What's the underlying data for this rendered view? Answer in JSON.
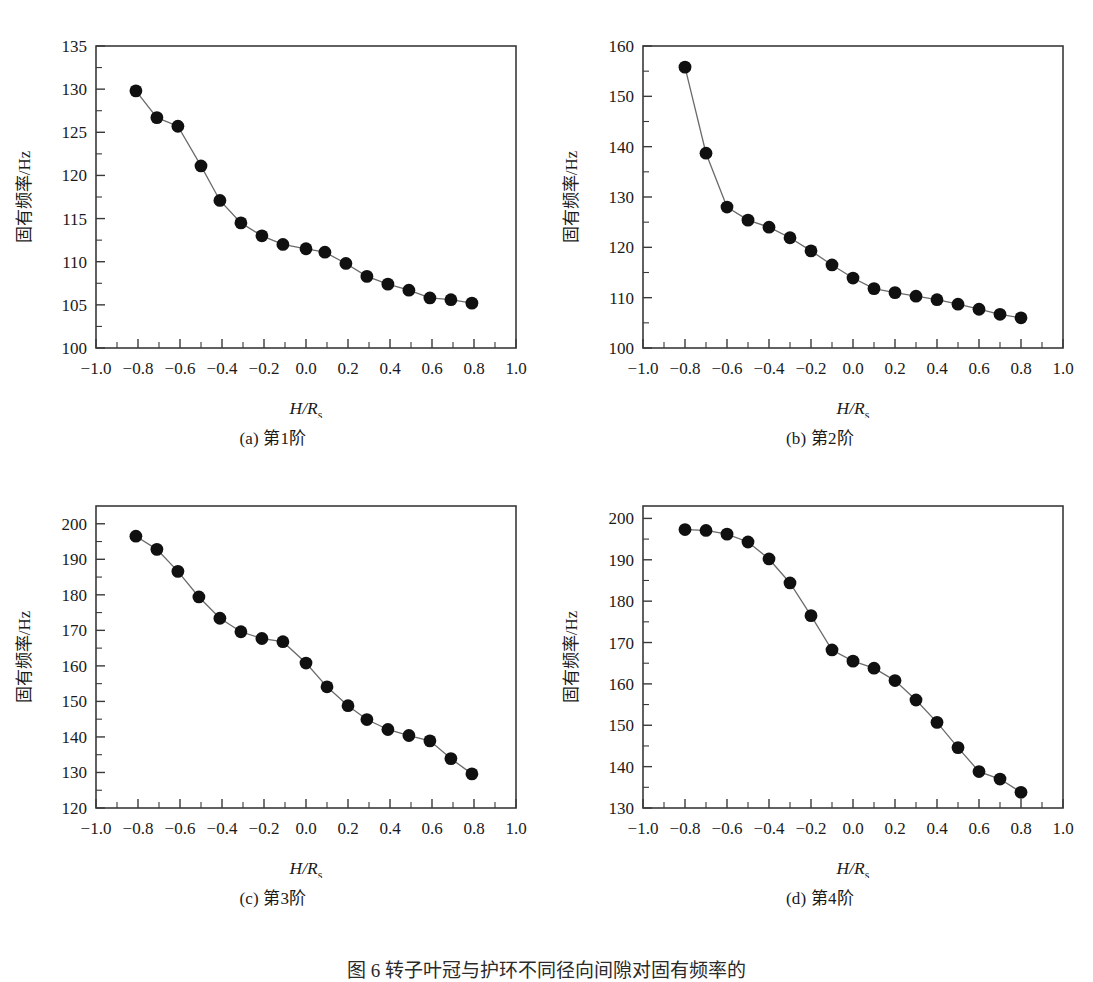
{
  "figure": {
    "caption": "图 6   转子叶冠与护环不同径向间隙对固有频率的",
    "axis_y_label": "固有频率/Hz",
    "axis_x_label_main": "H/R",
    "axis_x_label_sub": "s",
    "x_ticks": [
      "-1.0",
      "-0.8",
      "-0.6",
      "-0.4",
      "-0.2",
      "0.0",
      "0.2",
      "0.4",
      "0.6",
      "0.8",
      "1.0"
    ],
    "marker_color": "#101010",
    "line_color": "#6b6b6b",
    "frame_color": "#3a3a3a"
  },
  "chart_data": [
    {
      "type": "line",
      "panel": "a",
      "caption": "(a) 第1阶",
      "title": "",
      "xlabel": "H/Rs",
      "ylabel": "固有频率/Hz",
      "xlim": [
        -1.0,
        1.0
      ],
      "ylim": [
        100,
        135
      ],
      "yticks": [
        100,
        105,
        110,
        115,
        120,
        125,
        130,
        135
      ],
      "ytick_labels": [
        "100",
        "105",
        "110",
        "115",
        "120",
        "125",
        "130",
        "135"
      ],
      "xticks": [
        -1.0,
        -0.8,
        -0.6,
        -0.4,
        -0.2,
        0.0,
        0.2,
        0.4,
        0.6,
        0.8,
        1.0
      ],
      "grid": false,
      "legend": null,
      "x": [
        -0.81,
        -0.71,
        -0.61,
        -0.5,
        -0.41,
        -0.31,
        -0.21,
        -0.11,
        0.0,
        0.09,
        0.19,
        0.29,
        0.39,
        0.49,
        0.59,
        0.69,
        0.79
      ],
      "values": [
        129.8,
        126.7,
        125.7,
        121.1,
        117.1,
        114.5,
        113.0,
        112.0,
        111.5,
        111.1,
        109.8,
        108.3,
        107.4,
        106.7,
        105.8,
        105.6,
        105.2
      ]
    },
    {
      "type": "line",
      "panel": "b",
      "caption": "(b) 第2阶",
      "title": "",
      "xlabel": "H/Rs",
      "ylabel": "固有频率/Hz",
      "xlim": [
        -1.0,
        1.0
      ],
      "ylim": [
        100,
        160
      ],
      "yticks": [
        100,
        110,
        120,
        130,
        140,
        150,
        160
      ],
      "ytick_labels": [
        "100",
        "110",
        "120",
        "130",
        "140",
        "150",
        "160"
      ],
      "xticks": [
        -1.0,
        -0.8,
        -0.6,
        -0.4,
        -0.2,
        0.0,
        0.2,
        0.4,
        0.6,
        0.8,
        1.0
      ],
      "grid": false,
      "legend": null,
      "x": [
        -0.8,
        -0.7,
        -0.6,
        -0.5,
        -0.4,
        -0.3,
        -0.2,
        -0.1,
        0.0,
        0.1,
        0.2,
        0.3,
        0.4,
        0.5,
        0.6,
        0.7,
        0.8
      ],
      "values": [
        155.8,
        138.7,
        128.0,
        125.4,
        124.0,
        121.9,
        119.3,
        116.5,
        113.9,
        111.8,
        111.0,
        110.3,
        109.6,
        108.7,
        107.7,
        106.7,
        106.0
      ]
    },
    {
      "type": "line",
      "panel": "c",
      "caption": "(c) 第3阶",
      "title": "",
      "xlabel": "H/Rs",
      "ylabel": "固有频率/Hz",
      "xlim": [
        -1.0,
        1.0
      ],
      "ylim": [
        120,
        205
      ],
      "yticks": [
        120,
        130,
        140,
        150,
        160,
        170,
        180,
        190,
        200
      ],
      "ytick_labels": [
        "120",
        "130",
        "140",
        "150",
        "160",
        "170",
        "180",
        "190",
        "200"
      ],
      "xticks": [
        -1.0,
        -0.8,
        -0.6,
        -0.4,
        -0.2,
        0.0,
        0.2,
        0.4,
        0.6,
        0.8,
        1.0
      ],
      "grid": false,
      "legend": null,
      "x": [
        -0.81,
        -0.71,
        -0.61,
        -0.51,
        -0.41,
        -0.31,
        -0.21,
        -0.11,
        0.0,
        0.1,
        0.2,
        0.29,
        0.39,
        0.49,
        0.59,
        0.69,
        0.79
      ],
      "values": [
        196.5,
        192.8,
        186.6,
        179.4,
        173.4,
        169.6,
        167.7,
        166.8,
        160.8,
        154.1,
        148.8,
        144.9,
        142.1,
        140.4,
        138.9,
        133.9,
        129.6
      ]
    },
    {
      "type": "line",
      "panel": "d",
      "caption": "(d) 第4阶",
      "title": "",
      "xlabel": "H/Rs",
      "ylabel": "固有频率/Hz",
      "xlim": [
        -1.0,
        1.0
      ],
      "ylim": [
        130,
        203
      ],
      "yticks": [
        130,
        140,
        150,
        160,
        170,
        180,
        190,
        200
      ],
      "ytick_labels": [
        "130",
        "140",
        "150",
        "160",
        "170",
        "180",
        "190",
        "200"
      ],
      "xticks": [
        -1.0,
        -0.8,
        -0.6,
        -0.4,
        -0.2,
        0.0,
        0.2,
        0.4,
        0.6,
        0.8,
        1.0
      ],
      "grid": false,
      "legend": null,
      "x": [
        -0.8,
        -0.7,
        -0.6,
        -0.5,
        -0.4,
        -0.3,
        -0.2,
        -0.1,
        0.0,
        0.1,
        0.2,
        0.3,
        0.4,
        0.5,
        0.6,
        0.7,
        0.8
      ],
      "values": [
        197.3,
        197.1,
        196.2,
        194.3,
        190.2,
        184.4,
        176.5,
        168.2,
        165.5,
        163.8,
        160.8,
        156.1,
        150.7,
        144.6,
        138.8,
        137.0,
        133.8
      ]
    }
  ]
}
